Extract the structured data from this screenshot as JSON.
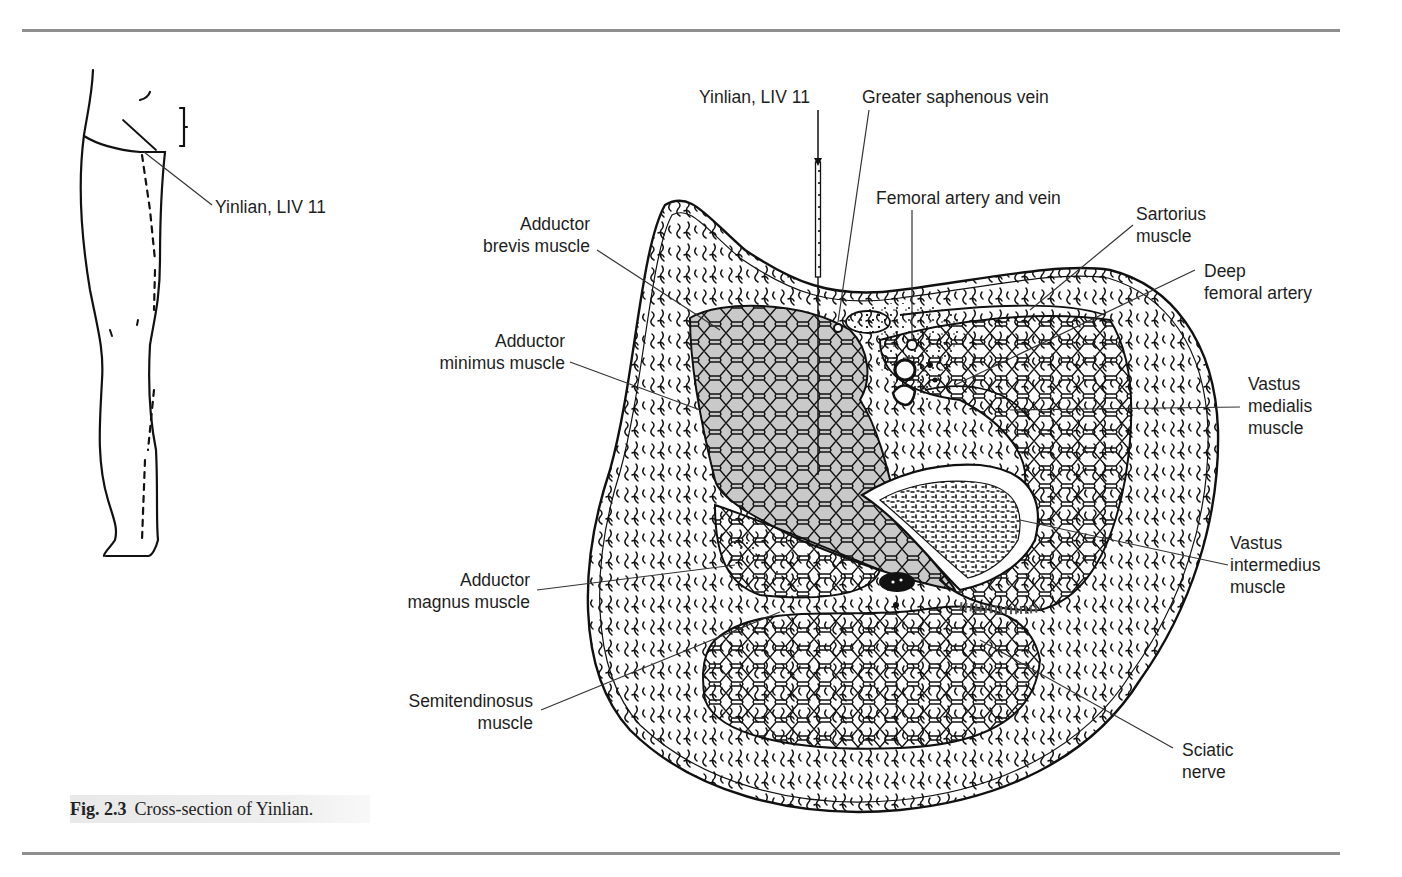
{
  "figure": {
    "number": "Fig. 2.3",
    "caption": "Cross-section of Yinlian.",
    "colors": {
      "rule": "#8f8f8f",
      "muscle_shaded": "#c9c9c9",
      "ink": "#111111",
      "caption_bg": "#ececec"
    }
  },
  "leg_sketch": {
    "point_label": "Yinlian, LIV 11"
  },
  "cross_section": {
    "labels": {
      "needle_point": "Yinlian, LIV 11",
      "greater_saphenous_vein": "Greater saphenous vein",
      "femoral_artery_vein": "Femoral artery and vein",
      "sartorius": [
        "Sartorius",
        "muscle"
      ],
      "deep_femoral_artery": [
        "Deep",
        "femoral artery"
      ],
      "vastus_medialis": [
        "Vastus",
        "medialis",
        "muscle"
      ],
      "vastus_intermedius": [
        "Vastus",
        "intermedius",
        "muscle"
      ],
      "sciatic_nerve": [
        "Sciatic",
        "nerve"
      ],
      "adductor_brevis": [
        "Adductor",
        "brevis muscle"
      ],
      "adductor_minimus": [
        "Adductor",
        "minimus muscle"
      ],
      "adductor_magnus": [
        "Adductor",
        "magnus muscle"
      ],
      "semitendinosus": [
        "Semitendinosus",
        "muscle"
      ]
    }
  }
}
